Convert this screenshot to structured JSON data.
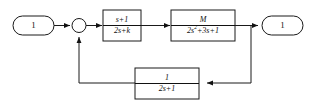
{
  "diagram": {
    "background_color": "#ffffff",
    "line_color": "#1a1a1a",
    "block_fill": "#ffffff",
    "input_terminal": {
      "label": "1",
      "shape": "rounded-rectangle"
    },
    "output_terminal": {
      "label": "1",
      "shape": "rounded-rectangle"
    },
    "summing_junction": {
      "label": "",
      "shape": "circle"
    },
    "blocks": [
      {
        "name": "controller",
        "numerator": "s+1",
        "denominator": "2s+k"
      },
      {
        "name": "plant",
        "numerator": "M",
        "denominator_pre": "2s",
        "denominator_exp": "2",
        "denominator_post": "+3s+1"
      },
      {
        "name": "feedback",
        "numerator": "1",
        "denominator": "2s+1"
      }
    ]
  }
}
